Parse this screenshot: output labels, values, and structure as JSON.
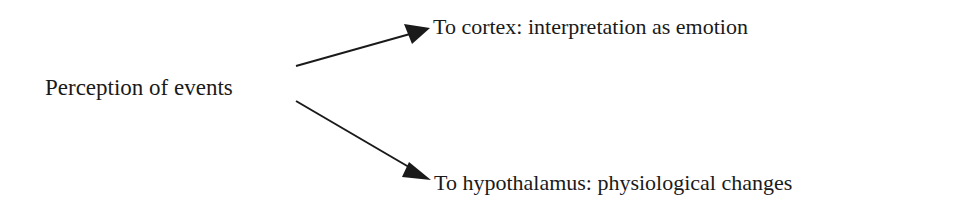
{
  "diagram": {
    "source": {
      "label": "Perception of events"
    },
    "targets": [
      {
        "label": "To cortex: interpretation as emotion"
      },
      {
        "label": "To hypothalamus: physiological changes"
      }
    ],
    "edges": [
      {
        "from": "Perception of events",
        "to": "To cortex: interpretation as emotion",
        "direction": "up-right"
      },
      {
        "from": "Perception of events",
        "to": "To hypothalamus: physiological changes",
        "direction": "down-right"
      }
    ],
    "colors": {
      "line": "#1a1a1a",
      "text": "#1a1a1a",
      "background": "#ffffff"
    }
  }
}
